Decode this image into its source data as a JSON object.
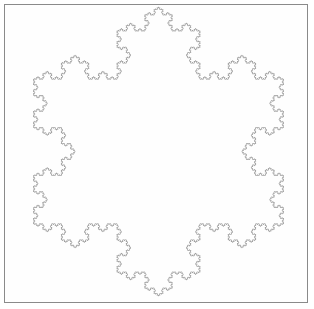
{
  "figure": {
    "kind": "fractal-curve-plot",
    "title": "",
    "caption": "",
    "background_color": "#ffffff",
    "plot_background_color": "#fefefe"
  },
  "frame": {
    "visible": true,
    "border_color": "#8a8a8a",
    "border_width_px": 1,
    "left_px": 4,
    "top_px": 4,
    "width_px": 304,
    "height_px": 299
  },
  "chart_data": {
    "type": "line",
    "title": "",
    "subtitle": "",
    "xlabel": "",
    "ylabel": "",
    "legend": [],
    "legend_position": "none",
    "grid": false,
    "axes_visible": false,
    "tick_labels_x": [],
    "tick_labels_y": [],
    "xlim": [
      0,
      1
    ],
    "ylim": [
      0,
      1
    ],
    "series": [
      {
        "name": "koch-island-outline",
        "stroke_color": "#9a9a9a",
        "stroke_width_px": 0.7,
        "closed": true,
        "fill": "none",
        "curve_family": "koch-snowflake-island",
        "lsystem": {
          "axiom": "F--F--F",
          "rule_F": "F+F--F+F",
          "iterations": 5,
          "turn_angle_deg": 60,
          "initial_heading_deg": 0
        },
        "bounding_box_px": {
          "x_min": 27,
          "y_min": 7,
          "x_max": 290,
          "y_max": 296
        },
        "vertex_count_estimate": 3072,
        "fractal_dimension": 1.2619
      }
    ],
    "annotations": []
  },
  "render": {
    "canvas_width_px": 314,
    "canvas_height_px": 309,
    "antialias": true
  }
}
